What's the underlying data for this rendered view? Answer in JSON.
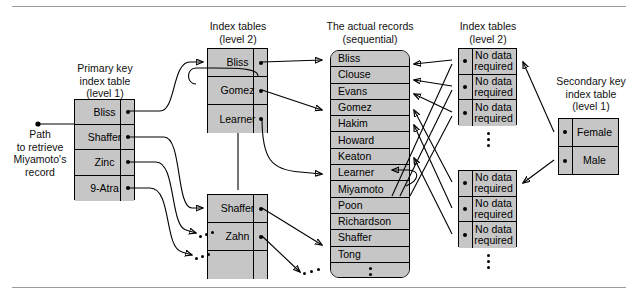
{
  "figure": {
    "path_note": "Path\nto retrieve\nMiyamoto's\nrecord"
  },
  "captions": {
    "primary_key": "Primary key\nindex table\n(level 1)",
    "index_level2_left": "Index tables\n(level 2)",
    "actual_records": "The actual records\n(sequential)",
    "index_level2_right": "Index tables\n(level 2)",
    "secondary_key": "Secondary key\nindex table\n(level 1)"
  },
  "primary_index": {
    "name": "Primary key index table (level 1)",
    "cells": [
      "Bliss",
      "Shaffer",
      "Zinc",
      "9-Atra"
    ]
  },
  "level2_left_a": {
    "cells": [
      "Bliss",
      "Gomez",
      "Learner"
    ]
  },
  "level2_left_b": {
    "cells": [
      "Shaffer",
      "Zahn",
      ""
    ]
  },
  "records": {
    "cells": [
      "Bliss",
      "Clouse",
      "Evans",
      "Gomez",
      "Hakim",
      "Howard",
      "Keaton",
      "Learner",
      "Miyamoto",
      "Poon",
      "Richardson",
      "Shaffer",
      "Tong"
    ],
    "continuation": "vertical-ellipsis"
  },
  "level2_right_a": {
    "cells": [
      "No data\nrequired",
      "No data\nrequired",
      "No data\nrequired"
    ]
  },
  "level2_right_b": {
    "cells": [
      "No data\nrequired",
      "No data\nrequired",
      "No data\nrequired"
    ]
  },
  "secondary_index": {
    "cells": [
      "Female",
      "Male"
    ]
  },
  "colors": {
    "cell_fill": "#c6c6c6",
    "stroke": "#000000",
    "rule": "#9b9b9b",
    "page": "#ffffff"
  }
}
